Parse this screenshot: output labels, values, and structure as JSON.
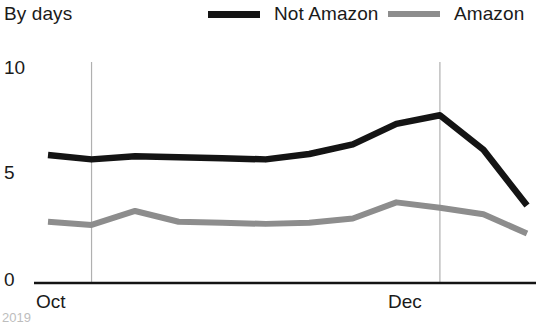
{
  "header": {
    "title": "By days"
  },
  "legend": {
    "position": "top-right",
    "items": [
      {
        "label": "Not Amazon",
        "color": "#141414",
        "swatch": "line-swatch-black"
      },
      {
        "label": "Amazon",
        "color": "#8d8d8d",
        "swatch": "line-swatch-gray"
      }
    ]
  },
  "axes": {
    "y_ticks": [
      "10",
      "5",
      "0"
    ],
    "x_ticks": [
      "Oct",
      "Dec"
    ]
  },
  "footnote": "2019",
  "chart_data": {
    "type": "line",
    "title": "By days",
    "xlabel": "",
    "ylabel": "",
    "ylim": [
      0,
      10
    ],
    "y_ticks": [
      0,
      5,
      10
    ],
    "grid": "vertical-only",
    "legend_position": "top-right",
    "x_tick_labels": [
      "Oct",
      "Dec"
    ],
    "x_tick_positions": [
      1,
      9
    ],
    "x": [
      0,
      1,
      2,
      3,
      4,
      5,
      6,
      7,
      8,
      9,
      10,
      11
    ],
    "series": [
      {
        "name": "Not Amazon",
        "color": "#141414",
        "values": [
          5.95,
          5.75,
          5.9,
          5.85,
          5.8,
          5.75,
          6.0,
          6.45,
          7.4,
          7.8,
          6.2,
          3.6
        ]
      },
      {
        "name": "Amazon",
        "color": "#8d8d8d",
        "values": [
          2.85,
          2.7,
          3.35,
          2.85,
          2.8,
          2.75,
          2.8,
          3.0,
          3.75,
          3.5,
          3.2,
          2.3
        ]
      }
    ]
  }
}
